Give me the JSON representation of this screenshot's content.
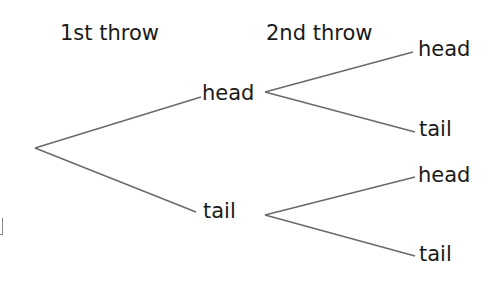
{
  "headers": {
    "first": "1st throw",
    "second": "2nd throw"
  },
  "tree": {
    "level1": [
      {
        "label": "head"
      },
      {
        "label": "tail"
      }
    ],
    "level2": [
      {
        "parent": "head",
        "label": "head"
      },
      {
        "parent": "head",
        "label": "tail"
      },
      {
        "parent": "tail",
        "label": "head"
      },
      {
        "parent": "tail",
        "label": "tail"
      }
    ]
  },
  "colors": {
    "line": "#6a6a6a",
    "text": "#1a1a1a",
    "background": "#ffffff"
  }
}
